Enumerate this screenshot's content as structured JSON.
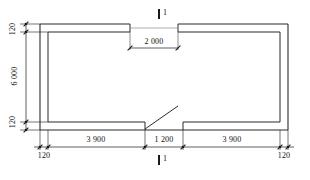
{
  "drawing": {
    "type": "architectural-floor-plan",
    "title": "",
    "units": "mm",
    "line_color": "#1a1a1a",
    "background_color": "#ffffff"
  },
  "dimensions": {
    "horizontal_bottom": [
      {
        "id": "left-bay",
        "label": "3 900",
        "value": 3900
      },
      {
        "id": "door-bay",
        "label": "1 200",
        "value": 1200
      },
      {
        "id": "right-bay",
        "label": "3 900",
        "value": 3900
      }
    ],
    "horizontal_inner": [
      {
        "id": "window-opening",
        "label": "2 000",
        "value": 2000
      }
    ],
    "vertical_left": [
      {
        "id": "top-wall",
        "label": "120",
        "value": 120
      },
      {
        "id": "room-depth",
        "label": "6 000",
        "value": 6000
      },
      {
        "id": "bottom-wall",
        "label": "120",
        "value": 120
      }
    ],
    "wall_thickness_marks": [
      {
        "id": "bottom-left-wall",
        "label": "120",
        "value": 120
      },
      {
        "id": "bottom-right-wall",
        "label": "120",
        "value": 120
      }
    ]
  },
  "section_markers": [
    {
      "id": "section-top",
      "label": "1",
      "position": "top"
    },
    {
      "id": "section-bottom",
      "label": "1",
      "position": "bottom"
    }
  ],
  "openings": [
    {
      "id": "top-window",
      "kind": "window",
      "wall": "top",
      "width_label": "2 000"
    },
    {
      "id": "bottom-door",
      "kind": "door",
      "wall": "bottom",
      "width_label": "1 200",
      "swing": "left-hinge-inward"
    }
  ]
}
